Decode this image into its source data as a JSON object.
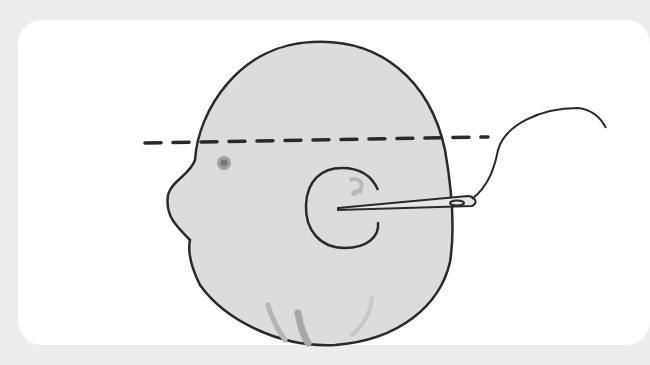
{
  "illustration": {
    "subject": "head-with-ear-needle-and-thread",
    "colors": {
      "background": "#ededed",
      "card": "#ffffff",
      "head_fill": "#dcdcdc",
      "outline": "#2a2a2a",
      "shadow": "#bdbdbd",
      "eye": "#8a8a8a"
    },
    "elements": [
      "head-outline",
      "dashed-cut-line",
      "eye",
      "ear",
      "needle",
      "thread",
      "chin-shading"
    ]
  }
}
